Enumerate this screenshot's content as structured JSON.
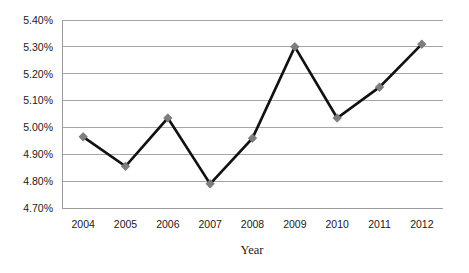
{
  "chart_data": {
    "type": "line",
    "title": "",
    "xlabel": "Year",
    "ylabel": "",
    "categories": [
      "2004",
      "2005",
      "2006",
      "2007",
      "2008",
      "2009",
      "2010",
      "2011",
      "2012"
    ],
    "values": [
      4.965,
      4.855,
      5.035,
      4.79,
      4.96,
      5.3,
      5.035,
      5.15,
      5.31
    ],
    "value_labels": [
      "4.97%",
      "4.86%",
      "5.04%",
      "4.79%",
      "4.96%",
      "5.30%",
      "5.04%",
      "5.15%",
      "5.31%"
    ],
    "ylim": [
      4.7,
      5.4
    ],
    "ytick_values": [
      4.7,
      4.8,
      4.9,
      5.0,
      5.1,
      5.2,
      5.3,
      5.4
    ],
    "ytick_labels": [
      "4.70%",
      "4.80%",
      "4.90%",
      "5.00%",
      "5.10%",
      "5.20%",
      "5.30%",
      "5.40%"
    ],
    "grid": "horizontal",
    "legend": "none",
    "series": [
      {
        "name": "",
        "values": [
          4.965,
          4.855,
          5.035,
          4.79,
          4.96,
          5.3,
          5.035,
          5.15,
          5.31
        ],
        "line_color": "#111111",
        "marker_color": "#7d7d7d",
        "marker_shape": "diamond"
      }
    ],
    "colors": {
      "line": "#111111",
      "marker": "#7d7d7d",
      "grid": "#9b9b9b",
      "frame": "#9b9b9b",
      "text": "#1a1a1a",
      "background": "#ffffff"
    },
    "plot_area": {
      "left": 62,
      "top": 20,
      "right": 443,
      "bottom": 208
    }
  }
}
